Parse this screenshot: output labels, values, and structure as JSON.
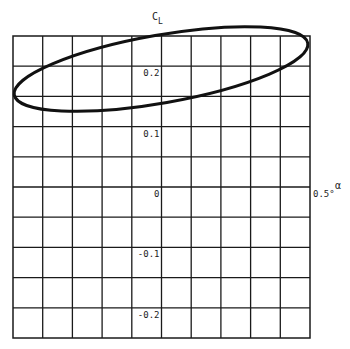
{
  "chart_data": {
    "type": "line",
    "title": "",
    "xlabel": "α",
    "ylabel": "C_L",
    "ylabel_main": "C",
    "ylabel_sub": "L",
    "xlim": [
      -0.5,
      0.5
    ],
    "ylim": [
      -0.25,
      0.25
    ],
    "x_unit": "°",
    "grid": true,
    "grid_divisions": {
      "x": 10,
      "y": 10
    },
    "x_tick_labels": [
      {
        "value": 0.5,
        "text": "0.5°"
      }
    ],
    "y_tick_labels": [
      {
        "value": 0.2,
        "text": "0.2"
      },
      {
        "value": 0.1,
        "text": "0.1"
      },
      {
        "value": 0.0,
        "text": "0"
      },
      {
        "value": -0.1,
        "text": "-0.1"
      },
      {
        "value": -0.2,
        "text": "-0.2"
      }
    ],
    "legend": null,
    "series": [
      {
        "name": "C_L vs α hysteresis loop",
        "shape": "ellipse",
        "center": {
          "alpha": 0.0,
          "cl": 0.195
        },
        "semi_major_alpha": 0.5,
        "tilt_deg": -10,
        "points": [
          {
            "alpha": -0.49,
            "cl": 0.152
          },
          {
            "alpha": -0.4,
            "cl": 0.19
          },
          {
            "alpha": -0.34,
            "cl": 0.21
          },
          {
            "alpha": -0.2,
            "cl": 0.231
          },
          {
            "alpha": -0.1,
            "cl": 0.245
          },
          {
            "alpha": 0.0,
            "cl": 0.254
          },
          {
            "alpha": 0.1,
            "cl": 0.26
          },
          {
            "alpha": 0.27,
            "cl": 0.265
          },
          {
            "alpha": 0.38,
            "cl": 0.262
          },
          {
            "alpha": 0.49,
            "cl": 0.238
          },
          {
            "alpha": 0.4,
            "cl": 0.2
          },
          {
            "alpha": 0.3,
            "cl": 0.185
          },
          {
            "alpha": 0.2,
            "cl": 0.17
          },
          {
            "alpha": 0.1,
            "cl": 0.157
          },
          {
            "alpha": 0.0,
            "cl": 0.141
          },
          {
            "alpha": -0.1,
            "cl": 0.128
          },
          {
            "alpha": -0.2,
            "cl": 0.125
          },
          {
            "alpha": -0.3,
            "cl": 0.127
          },
          {
            "alpha": -0.4,
            "cl": 0.135
          },
          {
            "alpha": -0.49,
            "cl": 0.152
          }
        ]
      }
    ]
  },
  "layout": {
    "plot_left": 13,
    "plot_right": 310,
    "plot_top": 36,
    "plot_bottom": 338,
    "ellipse_px": {
      "cx": 161,
      "cy": 69,
      "rx": 149,
      "ry": 34,
      "rotate": -10
    }
  }
}
